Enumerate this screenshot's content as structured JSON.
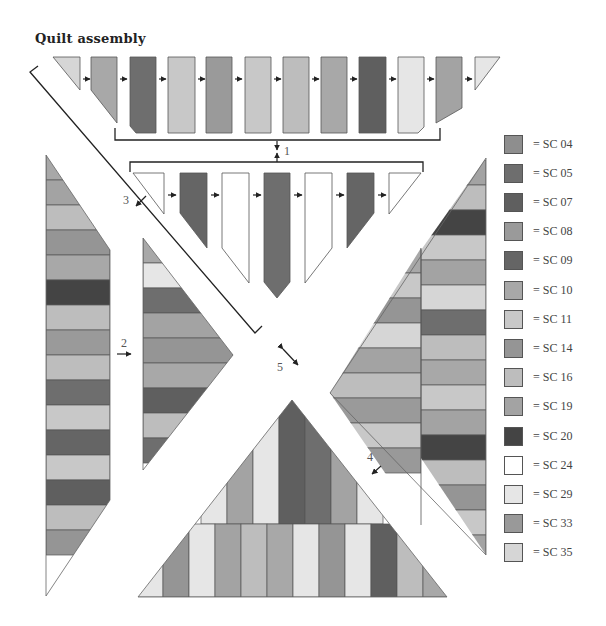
{
  "title": "Quilt assembly",
  "colors": {
    "SC04": "#8e8e8e",
    "SC05": "#6e6e6e",
    "SC07": "#5f5f5f",
    "SC08": "#9a9a9a",
    "SC09": "#656565",
    "SC10": "#a8a8a8",
    "SC11": "#c8c8c8",
    "SC14": "#959595",
    "SC16": "#bdbdbd",
    "SC19": "#a3a3a3",
    "SC20": "#444444",
    "SC24": "#ffffff",
    "SC29": "#e6e6e6",
    "SC33": "#999999",
    "SC35": "#d6d6d6",
    "outline": "#555555",
    "line": "#222222"
  },
  "legend": [
    {
      "code": "SC04",
      "label": "= SC 04"
    },
    {
      "code": "SC05",
      "label": "= SC 05"
    },
    {
      "code": "SC07",
      "label": "= SC 07"
    },
    {
      "code": "SC08",
      "label": "= SC 08"
    },
    {
      "code": "SC09",
      "label": "= SC 09"
    },
    {
      "code": "SC10",
      "label": "= SC 10"
    },
    {
      "code": "SC11",
      "label": "= SC 11"
    },
    {
      "code": "SC14",
      "label": "= SC 14"
    },
    {
      "code": "SC16",
      "label": "= SC 16"
    },
    {
      "code": "SC19",
      "label": "= SC 19"
    },
    {
      "code": "SC20",
      "label": "= SC 20"
    },
    {
      "code": "SC24",
      "label": "= SC 24"
    },
    {
      "code": "SC29",
      "label": "= SC 29"
    },
    {
      "code": "SC33",
      "label": "= SC 33"
    },
    {
      "code": "SC35",
      "label": "= SC 35"
    }
  ],
  "steps": [
    {
      "id": "1",
      "label": "1"
    },
    {
      "id": "2",
      "label": "2"
    },
    {
      "id": "3",
      "label": "3"
    },
    {
      "id": "4",
      "label": "4"
    },
    {
      "id": "5",
      "label": "5"
    }
  ],
  "rows": {
    "top_row": [
      "SC35",
      "SC10",
      "SC05",
      "SC11",
      "SC08",
      "SC11",
      "SC16",
      "SC10",
      "SC07",
      "SC29",
      "SC19",
      "SC29"
    ],
    "second_row": [
      "SC24",
      "SC09",
      "SC24",
      "SC05",
      "SC24",
      "SC09",
      "SC24"
    ],
    "left_strip": [
      "SC10",
      "SC19",
      "SC16",
      "SC14",
      "SC10",
      "SC20",
      "SC16",
      "SC08",
      "SC16",
      "SC05",
      "SC11",
      "SC09",
      "SC11",
      "SC07",
      "SC16",
      "SC14"
    ],
    "middle_left_triangle": [
      "SC10",
      "SC29",
      "SC05",
      "SC19",
      "SC14",
      "SC10",
      "SC07",
      "SC16",
      "SC05"
    ],
    "right_inner_strip": [
      "SC19",
      "SC16",
      "SC20",
      "SC11",
      "SC19",
      "SC35",
      "SC05",
      "SC16",
      "SC10",
      "SC11",
      "SC19",
      "SC20",
      "SC16",
      "SC14",
      "SC11",
      "SC19",
      "SC35"
    ],
    "right_outer_triangle": [
      "SC10",
      "SC11",
      "SC14",
      "SC35",
      "SC19",
      "SC16",
      "SC08",
      "SC11",
      "SC33"
    ],
    "bottom_top_tier": [
      "SC29",
      "SC19",
      "SC29",
      "SC07",
      "SC05",
      "SC19",
      "SC29"
    ],
    "bottom_base_tier": [
      "SC29",
      "SC14",
      "SC29",
      "SC19",
      "SC16",
      "SC10",
      "SC29",
      "SC14",
      "SC29",
      "SC07",
      "SC16",
      "SC10"
    ]
  }
}
